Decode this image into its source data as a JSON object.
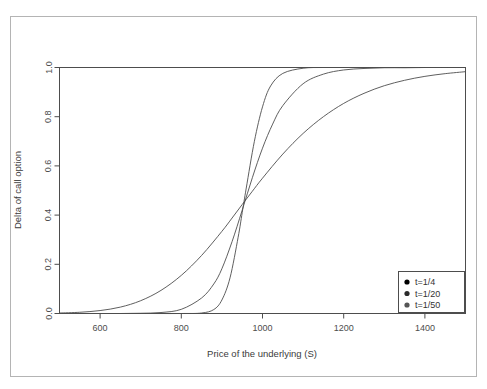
{
  "chart_data": {
    "type": "line",
    "title": "",
    "xlabel": "Price of the underlying (S)",
    "ylabel": "Delta of call option",
    "xlim": [
      500,
      1500
    ],
    "ylim": [
      0.0,
      1.0
    ],
    "xticks": [
      600,
      800,
      1000,
      1200,
      1400
    ],
    "xtick_labels": [
      "600",
      "800",
      "1000",
      "1200",
      "1400"
    ],
    "yticks": [
      0.0,
      0.2,
      0.4,
      0.6,
      0.8,
      1.0
    ],
    "ytick_labels": [
      "0.0",
      "0.2",
      "0.4",
      "0.6",
      "0.8",
      "1.0"
    ],
    "grid": false,
    "legend_position": "bottom-right",
    "legend_marker": "filled-circle",
    "line_color": "#4d4d4d",
    "series": [
      {
        "name": "t=1/4",
        "marker_color": "#000000",
        "x": [
          500,
          550,
          600,
          650,
          700,
          750,
          800,
          850,
          900,
          925,
          950,
          975,
          1000,
          1050,
          1100,
          1150,
          1200,
          1250,
          1300,
          1350,
          1400,
          1450,
          1500
        ],
        "values": [
          0.002,
          0.005,
          0.012,
          0.026,
          0.052,
          0.094,
          0.155,
          0.236,
          0.334,
          0.388,
          0.443,
          0.497,
          0.55,
          0.648,
          0.732,
          0.8,
          0.854,
          0.895,
          0.926,
          0.948,
          0.964,
          0.975,
          0.983
        ]
      },
      {
        "name": "t=1/20",
        "marker_color": "#2b2b2b",
        "x": [
          500,
          550,
          600,
          650,
          700,
          750,
          800,
          850,
          880,
          900,
          925,
          950,
          975,
          1000,
          1025,
          1050,
          1100,
          1150,
          1200,
          1250,
          1300,
          1350,
          1400,
          1450,
          1500
        ],
        "values": [
          0.0,
          0.0,
          0.0,
          0.0,
          0.001,
          0.004,
          0.017,
          0.063,
          0.12,
          0.182,
          0.292,
          0.42,
          0.552,
          0.672,
          0.77,
          0.845,
          0.934,
          0.973,
          0.99,
          0.996,
          0.999,
          0.999,
          1.0,
          1.0,
          1.0
        ]
      },
      {
        "name": "t=1/50",
        "marker_color": "#555555",
        "x": [
          500,
          600,
          700,
          800,
          850,
          880,
          900,
          920,
          940,
          950,
          960,
          980,
          1000,
          1020,
          1050,
          1100,
          1150,
          1200,
          1250,
          1300,
          1400,
          1500
        ],
        "values": [
          0.0,
          0.0,
          0.0,
          0.0,
          0.002,
          0.016,
          0.055,
          0.145,
          0.31,
          0.41,
          0.51,
          0.7,
          0.84,
          0.925,
          0.976,
          0.997,
          1.0,
          1.0,
          1.0,
          1.0,
          1.0,
          1.0
        ]
      }
    ]
  },
  "axes": {
    "xlabel": "Price of the underlying (S)",
    "ylabel": "Delta of call option"
  },
  "legend": {
    "items": [
      {
        "label": "t=1/4"
      },
      {
        "label": "t=1/20"
      },
      {
        "label": "t=1/50"
      }
    ]
  },
  "xtick_labels": [
    "600",
    "800",
    "1000",
    "1200",
    "1400"
  ],
  "ytick_labels": [
    "0.0",
    "0.2",
    "0.4",
    "0.6",
    "0.8",
    "1.0"
  ]
}
